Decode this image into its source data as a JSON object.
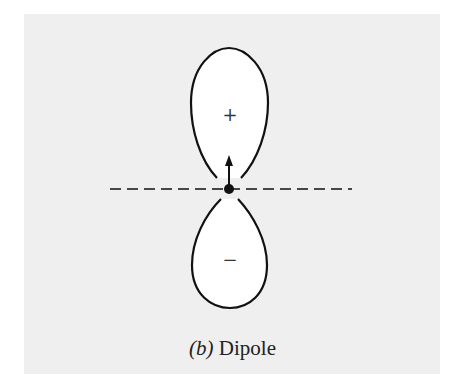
{
  "figure": {
    "label": "(b)",
    "title": "Dipole",
    "upper_lobe_sign": "+",
    "lower_lobe_sign": "−",
    "colors": {
      "background": "#efefef",
      "stroke": "#111111",
      "lobe_fill": "#ffffff"
    },
    "elements": [
      "upper positive lobe",
      "lower negative lobe",
      "dipole moment arrow",
      "central dot",
      "dashed horizontal axis"
    ]
  }
}
